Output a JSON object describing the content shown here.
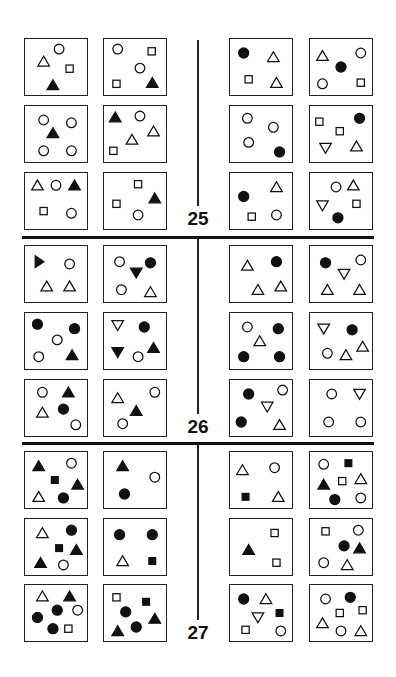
{
  "sections": [
    {
      "number": "25",
      "left": [
        [
          [
            "circle-open",
            0.55,
            0.18
          ],
          [
            "triangle-open",
            0.3,
            0.4
          ],
          [
            "square-open",
            0.72,
            0.53
          ],
          [
            "triangle-filled",
            0.45,
            0.82
          ]
        ],
        [
          [
            "circle-open",
            0.22,
            0.18
          ],
          [
            "square-open",
            0.77,
            0.22
          ],
          [
            "circle-open",
            0.58,
            0.52
          ],
          [
            "square-open",
            0.2,
            0.8
          ],
          [
            "triangle-filled",
            0.78,
            0.78
          ]
        ],
        [
          [
            "circle-open",
            0.3,
            0.25
          ],
          [
            "circle-open",
            0.75,
            0.3
          ],
          [
            "triangle-filled",
            0.45,
            0.48
          ],
          [
            "circle-open",
            0.3,
            0.8
          ],
          [
            "circle-open",
            0.75,
            0.8
          ]
        ],
        [
          [
            "triangle-filled",
            0.18,
            0.2
          ],
          [
            "circle-open",
            0.58,
            0.18
          ],
          [
            "triangle-open",
            0.8,
            0.45
          ],
          [
            "triangle-open",
            0.45,
            0.6
          ],
          [
            "square-open",
            0.15,
            0.8
          ]
        ],
        [
          [
            "triangle-open",
            0.2,
            0.22
          ],
          [
            "circle-open",
            0.5,
            0.22
          ],
          [
            "triangle-filled",
            0.8,
            0.22
          ],
          [
            "square-open",
            0.3,
            0.68
          ],
          [
            "circle-open",
            0.75,
            0.72
          ]
        ],
        [
          [
            "square-open",
            0.55,
            0.2
          ],
          [
            "triangle-filled",
            0.82,
            0.45
          ],
          [
            "square-open",
            0.2,
            0.55
          ],
          [
            "circle-open",
            0.55,
            0.75
          ]
        ]
      ],
      "right": [
        [
          [
            "circle-filled",
            0.22,
            0.25
          ],
          [
            "triangle-open",
            0.7,
            0.32
          ],
          [
            "square-open",
            0.3,
            0.72
          ],
          [
            "triangle-open",
            0.75,
            0.78
          ]
        ],
        [
          [
            "triangle-open",
            0.2,
            0.3
          ],
          [
            "circle-open",
            0.82,
            0.25
          ],
          [
            "circle-filled",
            0.5,
            0.5
          ],
          [
            "circle-open",
            0.2,
            0.8
          ],
          [
            "square-open",
            0.82,
            0.78
          ]
        ],
        [
          [
            "circle-open",
            0.28,
            0.22
          ],
          [
            "circle-open",
            0.7,
            0.38
          ],
          [
            "circle-open",
            0.3,
            0.65
          ],
          [
            "circle-filled",
            0.8,
            0.82
          ]
        ],
        [
          [
            "square-open",
            0.15,
            0.28
          ],
          [
            "circle-filled",
            0.8,
            0.22
          ],
          [
            "square-open",
            0.48,
            0.45
          ],
          [
            "triangle-down-open",
            0.25,
            0.75
          ],
          [
            "triangle-open",
            0.75,
            0.72
          ]
        ],
        [
          [
            "triangle-open",
            0.75,
            0.25
          ],
          [
            "circle-filled",
            0.22,
            0.42
          ],
          [
            "square-open",
            0.35,
            0.78
          ],
          [
            "circle-open",
            0.75,
            0.75
          ]
        ],
        [
          [
            "circle-open",
            0.42,
            0.25
          ],
          [
            "triangle-open",
            0.7,
            0.22
          ],
          [
            "triangle-down-open",
            0.2,
            0.58
          ],
          [
            "square-open",
            0.75,
            0.55
          ],
          [
            "circle-filled",
            0.45,
            0.8
          ]
        ]
      ]
    },
    {
      "number": "26",
      "left": [
        [
          [
            "triangle-right-filled",
            0.22,
            0.28
          ],
          [
            "circle-open",
            0.72,
            0.32
          ],
          [
            "triangle-open",
            0.35,
            0.72
          ],
          [
            "triangle-open",
            0.72,
            0.72
          ]
        ],
        [
          [
            "circle-open",
            0.25,
            0.28
          ],
          [
            "circle-filled",
            0.75,
            0.3
          ],
          [
            "triangle-down-filled",
            0.52,
            0.48
          ],
          [
            "circle-open",
            0.28,
            0.78
          ],
          [
            "triangle-open",
            0.75,
            0.82
          ]
        ],
        [
          [
            "circle-filled",
            0.2,
            0.2
          ],
          [
            "circle-filled",
            0.8,
            0.28
          ],
          [
            "circle-open",
            0.52,
            0.48
          ],
          [
            "circle-open",
            0.22,
            0.78
          ],
          [
            "triangle-filled",
            0.76,
            0.75
          ]
        ],
        [
          [
            "triangle-down-open",
            0.22,
            0.22
          ],
          [
            "circle-filled",
            0.65,
            0.25
          ],
          [
            "triangle-filled",
            0.8,
            0.62
          ],
          [
            "triangle-down-filled",
            0.22,
            0.7
          ],
          [
            "circle-open",
            0.55,
            0.78
          ]
        ],
        [
          [
            "circle-open",
            0.28,
            0.22
          ],
          [
            "triangle-filled",
            0.7,
            0.22
          ],
          [
            "triangle-open",
            0.28,
            0.58
          ],
          [
            "circle-filled",
            0.62,
            0.52
          ],
          [
            "circle-open",
            0.82,
            0.8
          ]
        ],
        [
          [
            "circle-open",
            0.82,
            0.22
          ],
          [
            "triangle-open",
            0.22,
            0.32
          ],
          [
            "triangle-filled",
            0.52,
            0.55
          ],
          [
            "circle-open",
            0.3,
            0.78
          ]
        ]
      ],
      "right": [
        [
          [
            "triangle-open",
            0.28,
            0.35
          ],
          [
            "circle-filled",
            0.75,
            0.28
          ],
          [
            "triangle-open",
            0.45,
            0.78
          ],
          [
            "triangle-open",
            0.82,
            0.72
          ]
        ],
        [
          [
            "circle-filled",
            0.25,
            0.3
          ],
          [
            "circle-open",
            0.82,
            0.25
          ],
          [
            "triangle-down-open",
            0.55,
            0.5
          ],
          [
            "triangle-open",
            0.28,
            0.78
          ],
          [
            "triangle-open",
            0.8,
            0.78
          ]
        ],
        [
          [
            "circle-open",
            0.28,
            0.25
          ],
          [
            "circle-filled",
            0.78,
            0.28
          ],
          [
            "triangle-open",
            0.48,
            0.5
          ],
          [
            "circle-filled",
            0.22,
            0.78
          ],
          [
            "circle-filled",
            0.8,
            0.78
          ]
        ],
        [
          [
            "triangle-down-open",
            0.22,
            0.28
          ],
          [
            "circle-filled",
            0.68,
            0.3
          ],
          [
            "triangle-open",
            0.85,
            0.6
          ],
          [
            "circle-open",
            0.28,
            0.72
          ],
          [
            "triangle-open",
            0.58,
            0.75
          ]
        ],
        [
          [
            "circle-filled",
            0.3,
            0.25
          ],
          [
            "circle-open",
            0.85,
            0.18
          ],
          [
            "triangle-down-open",
            0.6,
            0.48
          ],
          [
            "circle-filled",
            0.18,
            0.75
          ],
          [
            "triangle-open",
            0.8,
            0.8
          ]
        ],
        [
          [
            "circle-open",
            0.35,
            0.25
          ],
          [
            "triangle-down-open",
            0.8,
            0.25
          ],
          [
            "circle-open",
            0.3,
            0.75
          ],
          [
            "circle-open",
            0.82,
            0.75
          ]
        ]
      ]
    },
    {
      "number": "27",
      "left": [
        [
          [
            "triangle-filled",
            0.22,
            0.25
          ],
          [
            "circle-open",
            0.75,
            0.2
          ],
          [
            "square-filled",
            0.48,
            0.5
          ],
          [
            "triangle-filled",
            0.85,
            0.58
          ],
          [
            "triangle-open",
            0.22,
            0.8
          ],
          [
            "circle-filled",
            0.62,
            0.82
          ]
        ],
        [
          [
            "triangle-filled",
            0.3,
            0.25
          ],
          [
            "circle-open",
            0.82,
            0.45
          ],
          [
            "circle-filled",
            0.33,
            0.75
          ]
        ],
        [
          [
            "triangle-open",
            0.28,
            0.25
          ],
          [
            "circle-filled",
            0.75,
            0.2
          ],
          [
            "square-filled",
            0.55,
            0.52
          ],
          [
            "triangle-filled",
            0.83,
            0.55
          ],
          [
            "triangle-filled",
            0.25,
            0.78
          ],
          [
            "circle-open",
            0.62,
            0.82
          ]
        ],
        [
          [
            "circle-filled",
            0.25,
            0.28
          ],
          [
            "circle-filled",
            0.78,
            0.28
          ],
          [
            "triangle-open",
            0.3,
            0.75
          ],
          [
            "square-filled",
            0.78,
            0.75
          ]
        ],
        [
          [
            "triangle-open",
            0.28,
            0.2
          ],
          [
            "triangle-filled",
            0.72,
            0.2
          ],
          [
            "circle-filled",
            0.52,
            0.45
          ],
          [
            "circle-open",
            0.85,
            0.45
          ],
          [
            "circle-filled",
            0.2,
            0.58
          ],
          [
            "circle-filled",
            0.45,
            0.78
          ],
          [
            "square-open",
            0.7,
            0.78
          ]
        ],
        [
          [
            "square-open",
            0.2,
            0.22
          ],
          [
            "square-filled",
            0.68,
            0.3
          ],
          [
            "circle-filled",
            0.35,
            0.48
          ],
          [
            "triangle-filled",
            0.82,
            0.6
          ],
          [
            "circle-filled",
            0.52,
            0.75
          ],
          [
            "triangle-filled",
            0.22,
            0.82
          ]
        ]
      ],
      "right": [
        [
          [
            "triangle-open",
            0.2,
            0.32
          ],
          [
            "circle-open",
            0.72,
            0.28
          ],
          [
            "square-filled",
            0.25,
            0.8
          ],
          [
            "triangle-open",
            0.78,
            0.8
          ]
        ],
        [
          [
            "circle-open",
            0.22,
            0.22
          ],
          [
            "square-filled",
            0.62,
            0.2
          ],
          [
            "triangle-filled",
            0.22,
            0.58
          ],
          [
            "square-open",
            0.52,
            0.52
          ],
          [
            "triangle-open",
            0.82,
            0.48
          ],
          [
            "circle-filled",
            0.4,
            0.85
          ],
          [
            "circle-open",
            0.82,
            0.82
          ]
        ],
        [
          [
            "square-open",
            0.72,
            0.25
          ],
          [
            "triangle-filled",
            0.3,
            0.55
          ],
          [
            "square-open",
            0.75,
            0.78
          ]
        ],
        [
          [
            "square-open",
            0.25,
            0.22
          ],
          [
            "circle-open",
            0.78,
            0.2
          ],
          [
            "circle-filled",
            0.55,
            0.48
          ],
          [
            "triangle-filled",
            0.8,
            0.52
          ],
          [
            "circle-open",
            0.22,
            0.78
          ],
          [
            "triangle-open",
            0.6,
            0.82
          ]
        ],
        [
          [
            "circle-filled",
            0.22,
            0.25
          ],
          [
            "triangle-open",
            0.58,
            0.25
          ],
          [
            "triangle-down-open",
            0.45,
            0.58
          ],
          [
            "square-filled",
            0.8,
            0.5
          ],
          [
            "square-open",
            0.25,
            0.8
          ],
          [
            "circle-open",
            0.82,
            0.82
          ]
        ],
        [
          [
            "circle-open",
            0.25,
            0.25
          ],
          [
            "circle-filled",
            0.65,
            0.22
          ],
          [
            "square-open",
            0.48,
            0.5
          ],
          [
            "square-open",
            0.85,
            0.45
          ],
          [
            "triangle-open",
            0.2,
            0.68
          ],
          [
            "circle-open",
            0.5,
            0.82
          ],
          [
            "triangle-open",
            0.82,
            0.82
          ]
        ]
      ]
    }
  ]
}
